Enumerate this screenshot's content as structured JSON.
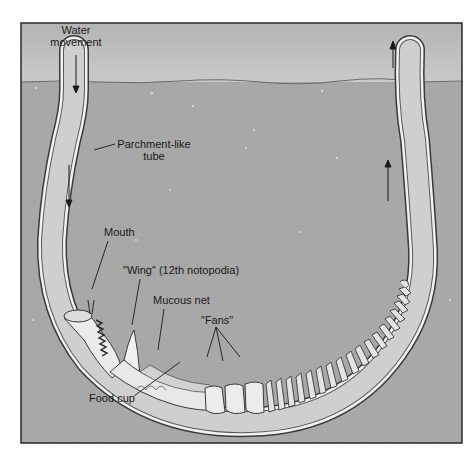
{
  "diagram": {
    "colors": {
      "frame_border": "#2a2a2a",
      "water": "#bdbdbd",
      "sediment": "#a9a9a9",
      "tube_wall": "#f2f2f2",
      "tube_lumen": "#cfcfcf",
      "worm_body": "#e6e6e6",
      "label_text": "#1a1a1a"
    },
    "labels": {
      "water_movement_line1": "Water",
      "water_movement_line2": "movement",
      "parchment_line1": "Parchment-like",
      "parchment_line2": "tube",
      "mouth": "Mouth",
      "wing": "\"Wing\" (12th notopodia)",
      "mucous_net": "Mucous net",
      "fans": "\"Fans\"",
      "food_cup": "Food cup"
    },
    "arrows": [
      {
        "id": "inflow-top",
        "direction": "down"
      },
      {
        "id": "inflow-left-tube",
        "direction": "down"
      },
      {
        "id": "outflow-right-tube",
        "direction": "up"
      },
      {
        "id": "outflow-top",
        "direction": "up"
      }
    ]
  }
}
